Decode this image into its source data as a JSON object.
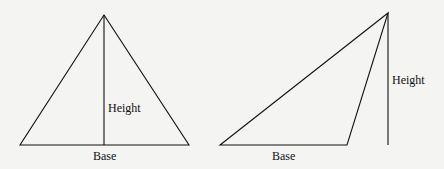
{
  "diagram": {
    "left_triangle": {
      "height_label": "Height",
      "base_label": "Base"
    },
    "right_triangle": {
      "height_label": "Height",
      "base_label": "Base"
    },
    "colors": {
      "background": "#f4f4f2",
      "stroke": "#111111"
    }
  }
}
